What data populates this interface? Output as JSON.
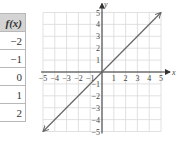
{
  "table": {
    "header": "f(x)",
    "values": [
      "−2",
      "−1",
      "0",
      "1",
      "2"
    ]
  },
  "chart_data": {
    "type": "line",
    "title": "",
    "xlabel": "x",
    "ylabel": "y",
    "xlim": [
      -5,
      5
    ],
    "ylim": [
      -5,
      5
    ],
    "grid": true,
    "x_ticks": [
      "−5",
      "−4",
      "−3",
      "−2",
      "−1",
      "1",
      "2",
      "3",
      "4",
      "5"
    ],
    "y_ticks": [
      "5",
      "4",
      "3",
      "2",
      "1",
      "−1",
      "−2",
      "−3",
      "−4",
      "−5"
    ],
    "series": [
      {
        "name": "f(x) = x",
        "x": [
          -5,
          5
        ],
        "y": [
          -5,
          5
        ],
        "arrows": "both"
      }
    ],
    "table": {
      "x": [
        -2,
        -1,
        0,
        1,
        2
      ],
      "f(x)": [
        -2,
        -1,
        0,
        1,
        2
      ]
    }
  },
  "colors": {
    "grid": "#d9d9d9",
    "axis": "#333333",
    "line": "#666666",
    "header_bg": "#d4d4d4"
  }
}
